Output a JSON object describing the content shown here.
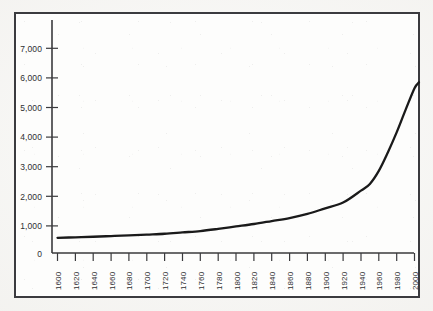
{
  "chart_data": {
    "type": "line",
    "title": "",
    "subtitle": "",
    "xlabel": "",
    "ylabel": "",
    "grid": false,
    "legend": "none",
    "xlim": [
      1600,
      2010
    ],
    "ylim": [
      0,
      7600
    ],
    "x_tick_labels": [
      "1600",
      "1620",
      "1640",
      "1660",
      "1680",
      "1700",
      "1720",
      "1740",
      "1760",
      "1780",
      "1800",
      "1820",
      "1840",
      "1860",
      "1880",
      "1900",
      "1920",
      "1940",
      "1960",
      "1980",
      "2000"
    ],
    "y_tick_labels": [
      "0",
      "1,000",
      "2,000",
      "3,000",
      "4,000",
      "5,000",
      "6,000",
      "7,000"
    ],
    "y_tick_values": [
      0,
      1000,
      2000,
      3000,
      4000,
      5000,
      6000,
      7000
    ],
    "series": [
      {
        "name": "World population (millions)",
        "color": "#1a1a1a",
        "x": [
          1600,
          1620,
          1640,
          1660,
          1680,
          1700,
          1720,
          1740,
          1760,
          1780,
          1800,
          1820,
          1840,
          1860,
          1880,
          1900,
          1920,
          1940,
          1950,
          1960,
          1970,
          1980,
          1990,
          2000,
          2005
        ],
        "values": [
          560,
          580,
          600,
          625,
          650,
          680,
          710,
          760,
          810,
          890,
          980,
          1070,
          1180,
          1290,
          1440,
          1650,
          1860,
          2300,
          2550,
          3030,
          3700,
          4450,
          5280,
          6080,
          6300
        ]
      }
    ],
    "annotations": []
  },
  "figure": {
    "frame_color": "#3b3b3f",
    "axis_color": "#3a3a3d",
    "plot_background": "#fdfdfc",
    "page_background": "#f2f1ee",
    "curve_color": "#1a1a1a",
    "tick_label_color": "#2e2e31"
  }
}
